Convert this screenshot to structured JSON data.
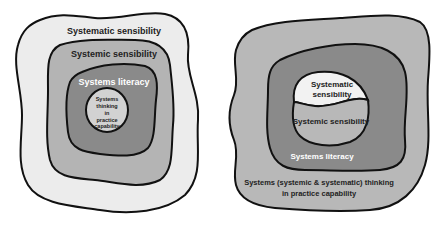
{
  "diagram_left": {
    "layers": [
      {
        "label": "Systematic sensibility",
        "fill": "#ececec",
        "text_color": "#222222"
      },
      {
        "label": "Systemic sensibility",
        "fill": "#b4b4b4",
        "text_color": "#222222"
      },
      {
        "label": "Systems literacy",
        "fill": "#8a8a8a",
        "text_color": "#ffffff"
      },
      {
        "label_lines": [
          "Systems",
          "thinking",
          "in",
          "practice",
          "capability"
        ],
        "fill": "#d2d2d2",
        "text_color": "#222222"
      }
    ]
  },
  "diagram_right": {
    "layers": [
      {
        "label_lines": [
          "Systems (systemic & systematic) thinking",
          "in practice capability"
        ],
        "fill": "#b8b8b8",
        "text_color": "#222222"
      },
      {
        "label": "Systems literacy",
        "fill": "#8a8a8a",
        "text_color": "#ffffff"
      },
      {
        "label_lines": [
          "Systematic",
          "sensibility"
        ],
        "fill": "#f2f2f2",
        "text_color": "#222222"
      },
      {
        "label": "Systemic sensibility",
        "fill": "#b8b8b8",
        "text_color": "#222222"
      }
    ]
  },
  "colors": {
    "outline": "#111111",
    "background": "#ffffff"
  }
}
